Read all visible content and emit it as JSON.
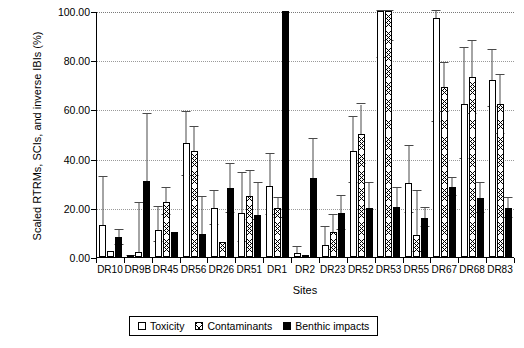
{
  "chart_data": {
    "type": "bar",
    "title": "",
    "xlabel": "Sites",
    "ylabel": "Scaled RTRMs, SCIs, and inverse IBIs (%)",
    "ylim": [
      0,
      100
    ],
    "yticks": [
      "0.00",
      "20.00",
      "40.00",
      "60.00",
      "80.00",
      "100.00"
    ],
    "ytick_values": [
      0,
      20,
      40,
      60,
      80,
      100
    ],
    "grid": "horizontal-dotted",
    "legend_position": "bottom-center",
    "categories": [
      "DR10",
      "DR9B",
      "DR45",
      "DR56",
      "DR26",
      "DR51",
      "DR1",
      "DR2",
      "DR23",
      "DR52",
      "DR53",
      "DR55",
      "DR67",
      "DR68",
      "DR83"
    ],
    "series": [
      {
        "name": "Toxicity",
        "fill": "open",
        "values": [
          13.0,
          0.5,
          11.0,
          46.5,
          20.0,
          18.0,
          29.0,
          1.5,
          5.0,
          43.0,
          100.0,
          30.0,
          97.0,
          62.0,
          72.0
        ],
        "errors_upper": [
          32.5,
          0.5,
          20.5,
          59.0,
          27.0,
          34.0,
          42.0,
          4.0,
          12.0,
          57.0,
          100.0,
          45.0,
          100.0,
          85.0,
          84.0
        ],
        "errors_lower": [
          0.0,
          0.0,
          6.0,
          33.0,
          13.0,
          6.0,
          17.0,
          0.0,
          0.0,
          30.0,
          81.0,
          18.0,
          55.0,
          40.0,
          61.0
        ]
      },
      {
        "name": "Contaminants",
        "fill": "crosshatch",
        "values": [
          2.5,
          2.0,
          22.5,
          43.0,
          6.0,
          25.0,
          20.0,
          0.5,
          10.0,
          50.0,
          100.0,
          9.0,
          69.0,
          73.0,
          62.0
        ],
        "errors_upper": [
          2.5,
          22.0,
          28.0,
          53.0,
          6.0,
          35.0,
          24.0,
          0.5,
          17.0,
          62.0,
          100.0,
          27.0,
          79.0,
          88.0,
          74.0
        ],
        "errors_lower": [
          2.5,
          2.0,
          17.0,
          33.0,
          6.0,
          15.0,
          16.0,
          0.5,
          3.0,
          38.0,
          88.0,
          2.0,
          59.0,
          58.0,
          50.0
        ]
      },
      {
        "name": "Benthic impacts",
        "fill": "solid",
        "values": [
          8.0,
          31.0,
          10.0,
          9.5,
          28.0,
          17.0,
          100.0,
          32.0,
          18.0,
          20.0,
          20.5,
          16.0,
          28.5,
          24.0,
          20.0
        ],
        "errors_upper": [
          11.0,
          58.0,
          10.0,
          24.5,
          38.0,
          30.0,
          100.0,
          48.0,
          25.0,
          30.0,
          28.0,
          20.0,
          32.0,
          30.0,
          24.0
        ],
        "errors_lower": [
          5.0,
          31.0,
          10.0,
          9.5,
          18.0,
          17.0,
          100.0,
          32.0,
          11.0,
          20.0,
          20.5,
          12.0,
          25.0,
          18.0,
          16.0
        ]
      }
    ]
  },
  "legend": {
    "items": [
      {
        "label": "Toxicity",
        "style": "toxicity"
      },
      {
        "label": "Contaminants",
        "style": "contaminants"
      },
      {
        "label": "Benthic impacts",
        "style": "benthic"
      }
    ]
  }
}
